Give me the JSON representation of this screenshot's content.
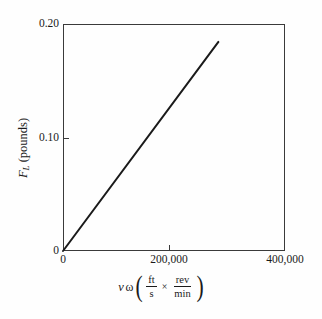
{
  "figure": {
    "background_color": "#fefefe",
    "frame_color": "#3a3a3a",
    "line_color": "#1a1a1a"
  },
  "axes": {
    "y": {
      "title_symbol": "F",
      "title_subscript": "L",
      "title_units": " (pounds)",
      "tick_labels": [
        "0.20",
        "0.10",
        "0"
      ],
      "tick_values": [
        0.2,
        0.1,
        0
      ],
      "min": 0,
      "max": 0.2
    },
    "x": {
      "title_symbol": "v",
      "title_omega": "ω",
      "numerator_1": "ft",
      "denominator_1": "s",
      "times_symbol": "×",
      "numerator_2": "rev",
      "denominator_2": "min",
      "paren_open": "(",
      "paren_close": ")",
      "tick_labels": [
        "0",
        "200,000",
        "400,000"
      ],
      "tick_values": [
        0,
        200000,
        400000
      ],
      "min": 0,
      "max": 400000
    }
  },
  "chart_data": {
    "type": "line",
    "title": "",
    "subtitle": "",
    "xlabel": "vω (ft/s × rev/min)",
    "ylabel": "F_L (pounds)",
    "xlim": [
      0,
      400000
    ],
    "ylim": [
      0,
      0.2
    ],
    "xticks": [
      0,
      200000,
      400000
    ],
    "xticklabels": [
      "0",
      "200,000",
      "400,000"
    ],
    "yticks": [
      0,
      0.1,
      0.2
    ],
    "yticklabels": [
      "0",
      "0.10",
      "0.20"
    ],
    "grid": false,
    "legend": null,
    "annotations": [],
    "series": [
      {
        "name": "F_L vs vω",
        "color": "#1a1a1a",
        "linewidth": 2,
        "x": [
          0,
          280000
        ],
        "y": [
          0,
          0.1842
        ],
        "slope": 6.579e-07,
        "intercept": 0
      }
    ]
  }
}
